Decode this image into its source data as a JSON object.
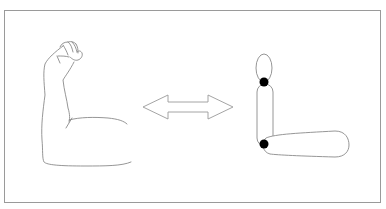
{
  "figure": {
    "description": "Line drawing of a flexed human arm (biceps pose) with a double-headed arrow pointing to a simplified mechanical model of the arm made of rounded segments joined by pivot points.",
    "left_panel": {
      "label": "flexed-human-arm"
    },
    "center": {
      "label": "double-headed-arrow"
    },
    "right_panel": {
      "label": "joint-segment-arm-model",
      "segments": [
        "hand",
        "upper-arm",
        "forearm"
      ],
      "joints": [
        "wrist-joint",
        "elbow-joint"
      ]
    },
    "colors": {
      "stroke": "#8a8a8a",
      "joint_fill": "#000000",
      "frame": "#9a9a9a",
      "background": "#ffffff"
    }
  }
}
